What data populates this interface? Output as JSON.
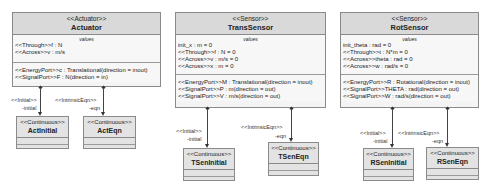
{
  "classes": {
    "actuator": {
      "stereotype": "<<Actuator>>",
      "name": "Actuator",
      "values_title": "values",
      "values": [
        "<<Through>>f : N",
        "<<Across>>v : m/s"
      ],
      "ports": [
        "<<EnergyPort>>c : Translational(direction = inout)",
        "<<SignalPort>>F : N(direction = in)"
      ]
    },
    "trans_sensor": {
      "stereotype": "<<Sensor>>",
      "name": "TransSensor",
      "values_title": "values",
      "values": [
        "init_x : m = 0",
        "<<Through>>f : N = 0",
        "<<Across>>v : m/s = 0",
        "<<Across>>x : m = 0"
      ],
      "ports": [
        "<<EnergyPort>>M : Translational(direction = inout)",
        "<<SignalPort>>P : m(direction = out)",
        "<<SignalPort>>V : m/s(direction = out)"
      ]
    },
    "rot_sensor": {
      "stereotype": "<<Sensor>>",
      "name": "RotSensor",
      "values_title": "values",
      "values": [
        "init_theta : rad = 0",
        "<<Through>>t : N*m = 0",
        "<<Across>>theta : rad = 0",
        "<<Across>>w : rad/s = 0"
      ],
      "ports": [
        "<<EnergyPort>>R : Rotational(direction = inout)",
        "<<SignalPort>>THETA : rad(direction = out)",
        "<<SignalPort>>W : rad/s(direction = out)"
      ]
    }
  },
  "parts": {
    "act_initial": {
      "stereotype": "<<Continuous>>",
      "name": "ActInitial",
      "assoc_stereotype": "<<Initial>>",
      "role": "-initial"
    },
    "act_eqn": {
      "stereotype": "<<Continuous>>",
      "name": "ActEqn",
      "assoc_stereotype": "<<IntrinsicEqn>>",
      "role": "-eqn"
    },
    "tsen_initial": {
      "stereotype": "<<Continuous>>",
      "name": "TSenInitial",
      "assoc_stereotype": "<<Initial>>",
      "role": "-initial"
    },
    "tsen_eqn": {
      "stereotype": "<<Continuous>>",
      "name": "TSenEqn",
      "assoc_stereotype": "<<IntrinsicEqn>>",
      "role": "-eqn"
    },
    "rsen_initial": {
      "stereotype": "<<Continuous>>",
      "name": "RSenInitial",
      "assoc_stereotype": "<<Initial>>",
      "role": "-initial"
    },
    "rsen_eqn": {
      "stereotype": "<<Continuous>>",
      "name": "RSenEqn",
      "assoc_stereotype": "<<IntrinsicEqn>>",
      "role": "-eqn"
    }
  }
}
